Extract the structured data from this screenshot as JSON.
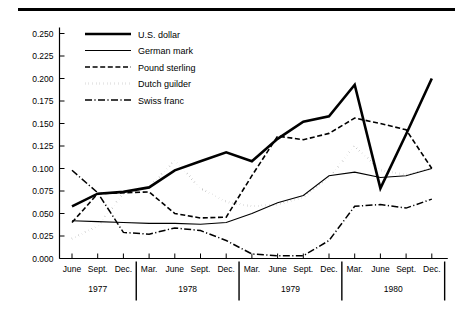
{
  "chart_data": {
    "type": "line",
    "title": "",
    "subtitle": "",
    "xlabel": "",
    "ylabel": "",
    "grid": false,
    "legend_position": "top-left-inside",
    "ylim": [
      0.0,
      0.25
    ],
    "ytick_labels": [
      "0.000",
      "0.025",
      "0.050",
      "0.075",
      "0.100",
      "0.125",
      "0.150",
      "0.175",
      "0.200",
      "0.225",
      "0.250"
    ],
    "ytick_values": [
      0.0,
      0.025,
      0.05,
      0.075,
      0.1,
      0.125,
      0.15,
      0.175,
      0.2,
      0.225,
      0.25
    ],
    "categories": [
      "June",
      "Sept.",
      "Dec.",
      "Mar.",
      "June",
      "Sept.",
      "Dec.",
      "Mar.",
      "June",
      "Sept.",
      "Dec.",
      "Mar.",
      "June",
      "Sept.",
      "Dec."
    ],
    "year_groups": [
      {
        "label": "1977",
        "start_index": 0,
        "end_index": 2
      },
      {
        "label": "1978",
        "start_index": 3,
        "end_index": 6
      },
      {
        "label": "1979",
        "start_index": 7,
        "end_index": 10
      },
      {
        "label": "1980",
        "start_index": 11,
        "end_index": 14
      }
    ],
    "series": [
      {
        "name": "U.S. dollar",
        "style": "solid-thick",
        "values": [
          0.058,
          0.072,
          0.074,
          0.079,
          0.098,
          0.108,
          0.118,
          0.108,
          0.133,
          0.152,
          0.158,
          0.193,
          0.078,
          0.138,
          0.2
        ]
      },
      {
        "name": "German mark",
        "style": "solid-thin",
        "values": [
          0.042,
          0.041,
          0.04,
          0.039,
          0.039,
          0.038,
          0.04,
          0.05,
          0.062,
          0.07,
          0.092,
          0.096,
          0.09,
          0.092,
          0.1
        ]
      },
      {
        "name": "Pound sterling",
        "style": "dashed",
        "values": [
          0.04,
          0.072,
          0.073,
          0.074,
          0.05,
          0.045,
          0.046,
          0.092,
          0.136,
          0.132,
          0.139,
          0.156,
          0.15,
          0.143,
          0.1
        ]
      },
      {
        "name": "Dutch guilder",
        "style": "dotted",
        "values": [
          0.022,
          0.036,
          0.072,
          0.079,
          0.109,
          0.078,
          0.063,
          0.058,
          0.06,
          0.068,
          0.09,
          0.125,
          0.098,
          0.093,
          0.1
        ]
      },
      {
        "name": "Swiss franc",
        "style": "dash-dot",
        "values": [
          0.098,
          0.073,
          0.029,
          0.027,
          0.034,
          0.031,
          0.02,
          0.005,
          0.003,
          0.003,
          0.02,
          0.058,
          0.06,
          0.056,
          0.066
        ]
      }
    ]
  },
  "legend": {
    "items": [
      {
        "label": "U.S. dollar",
        "style": "solid-thick"
      },
      {
        "label": "German mark",
        "style": "solid-thin"
      },
      {
        "label": "Pound sterling",
        "style": "dashed"
      },
      {
        "label": "Dutch guilder",
        "style": "dotted"
      },
      {
        "label": "Swiss franc",
        "style": "dash-dot"
      }
    ]
  }
}
